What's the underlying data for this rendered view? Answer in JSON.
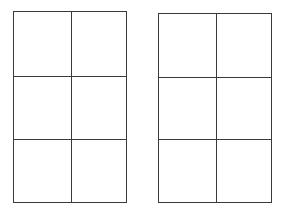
{
  "diagram": {
    "line_color": "#3a3a3a",
    "background": "#ffffff",
    "grids": [
      {
        "name": "left-grid",
        "columns": 2,
        "rows": 3,
        "cells": [
          [
            "",
            ""
          ],
          [
            "",
            ""
          ],
          [
            "",
            ""
          ]
        ],
        "box": {
          "x": 13,
          "y": 11,
          "width": 114,
          "height": 192
        },
        "col_dividers_x": [
          57
        ],
        "row_dividers_y": [
          64,
          127
        ]
      },
      {
        "name": "right-grid",
        "columns": 2,
        "rows": 3,
        "cells": [
          [
            "",
            ""
          ],
          [
            "",
            ""
          ],
          [
            "",
            ""
          ]
        ],
        "box": {
          "x": 158,
          "y": 13,
          "width": 114,
          "height": 190
        },
        "col_dividers_x": [
          57
        ],
        "row_dividers_y": [
          63,
          125
        ]
      }
    ]
  }
}
